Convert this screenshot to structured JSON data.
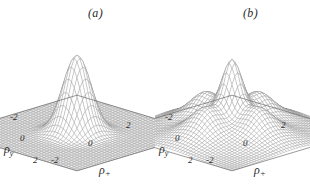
{
  "figure": {
    "background_color": "#ffffff",
    "mesh_color": "#8a8a8a",
    "text_color": "#2b2b2b"
  },
  "panels": [
    {
      "id": "a",
      "label": "(a)",
      "axes": {
        "x": {
          "label_rho": "ρ",
          "label_sub": "+",
          "ticks": [
            "-2",
            "0",
            "2"
          ]
        },
        "y": {
          "label_rho": "ρ",
          "label_sub": "y",
          "ticks": [
            "-2",
            "0",
            "2"
          ]
        }
      }
    },
    {
      "id": "b",
      "label": "(b)",
      "axes": {
        "x": {
          "label_rho": "ρ",
          "label_sub": "+",
          "ticks": [
            "-2",
            "0",
            "2"
          ]
        },
        "y": {
          "label_rho": "ρ",
          "label_sub": "y",
          "ticks": [
            "-2",
            "0",
            "2"
          ]
        }
      }
    }
  ],
  "chart_data": [
    {
      "type": "surface",
      "panel": "a",
      "title": "(a)",
      "xlabel": "ρ+",
      "ylabel": "ρy",
      "zlabel": "",
      "xlim": [
        -2.6,
        2.6
      ],
      "ylim": [
        -2.6,
        2.6
      ],
      "zlim": [
        0,
        1
      ],
      "xticks": [
        -2,
        0,
        2
      ],
      "yticks": [
        -2,
        0,
        2
      ],
      "grid": true,
      "legend": "none",
      "description": "Single narrow Gaussian-like central peak rising from a flat base plane; wireframe mesh surface.",
      "surface_model": {
        "formula": "exp(-(x^2+y^2)/(2*s^2))",
        "sigma": 0.42,
        "amplitude": 1.0,
        "center": [
          0,
          0
        ]
      },
      "peaks": [
        {
          "x": 0,
          "y": 0,
          "z": 1.0
        }
      ],
      "z_profile_y0": {
        "x": [
          -2.5,
          -2.0,
          -1.5,
          -1.0,
          -0.5,
          0.0,
          0.5,
          1.0,
          1.5,
          2.0,
          2.5
        ],
        "z": [
          0.0,
          0.0,
          0.0,
          0.06,
          0.49,
          1.0,
          0.49,
          0.06,
          0.0,
          0.0,
          0.0
        ]
      }
    },
    {
      "type": "surface",
      "panel": "b",
      "title": "(b)",
      "xlabel": "ρ+",
      "ylabel": "ρy",
      "zlabel": "",
      "xlim": [
        -2.6,
        2.6
      ],
      "ylim": [
        -2.6,
        2.6
      ],
      "zlim": [
        0,
        1
      ],
      "xticks": [
        -2,
        0,
        2
      ],
      "yticks": [
        -2,
        0,
        2
      ],
      "grid": true,
      "legend": "none",
      "description": "Tall central spike on a broad raised skirt, surrounded by four smaller satellite ripple peaks; wireframe mesh surface.",
      "surface_model": {
        "formula": "0.82*exp(-(x^2+y^2)/(2*0.30^2)) + 0.40*exp(-(x^2+y^2)/(2*1.15^2)) + sum_i A_i*exp(-((x-xi)^2+(y-yi)^2)/(2*0.33^2))",
        "core_sigma": 0.3,
        "core_amplitude": 0.82,
        "skirt_sigma": 1.15,
        "skirt_amplitude": 0.4
      },
      "peaks": [
        {
          "x": 0.0,
          "y": 0.0,
          "z": 1.0
        },
        {
          "x": -1.1,
          "y": 0.0,
          "z": 0.42
        },
        {
          "x": 1.1,
          "y": 0.0,
          "z": 0.42
        },
        {
          "x": 0.0,
          "y": -1.1,
          "z": 0.4
        },
        {
          "x": 0.0,
          "y": 1.1,
          "z": 0.4
        }
      ],
      "z_profile_y0": {
        "x": [
          -2.5,
          -2.0,
          -1.5,
          -1.0,
          -0.5,
          0.0,
          0.5,
          1.0,
          1.5,
          2.0,
          2.5
        ],
        "z": [
          0.03,
          0.1,
          0.26,
          0.42,
          0.48,
          1.0,
          0.48,
          0.42,
          0.26,
          0.1,
          0.03
        ]
      }
    }
  ]
}
